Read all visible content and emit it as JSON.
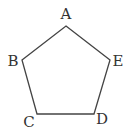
{
  "diagram": {
    "type": "pentagon",
    "stroke_color": "#444444",
    "vertices": [
      {
        "label": "A",
        "x": 66,
        "y": 26
      },
      {
        "label": "E",
        "x": 110,
        "y": 60
      },
      {
        "label": "D",
        "x": 94,
        "y": 114
      },
      {
        "label": "C",
        "x": 37,
        "y": 114
      },
      {
        "label": "B",
        "x": 22,
        "y": 60
      }
    ],
    "labels": {
      "A": "A",
      "B": "B",
      "C": "C",
      "D": "D",
      "E": "E"
    }
  }
}
